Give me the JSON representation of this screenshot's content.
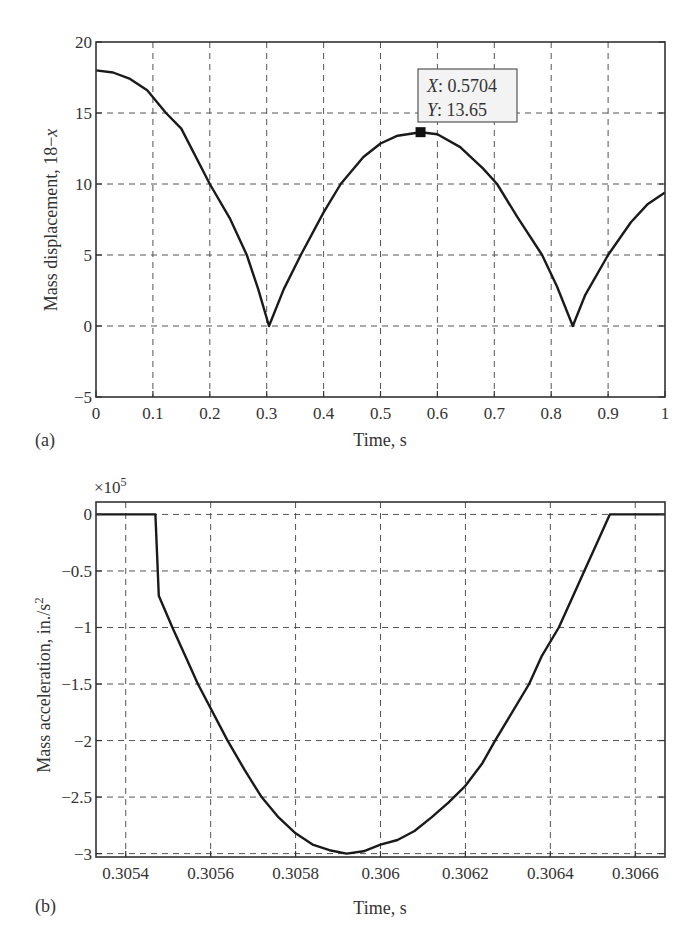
{
  "chart_data": [
    {
      "panel": "(a)",
      "type": "line",
      "title": "",
      "xlabel": "Time, s",
      "ylabel": "Mass displacement, 18−x",
      "ylabel_parts": {
        "main": "Mass displacement, 18−",
        "italic": "x"
      },
      "xlim": [
        0,
        1
      ],
      "ylim": [
        -5,
        20
      ],
      "xticks": [
        0,
        0.1,
        0.2,
        0.3,
        0.4,
        0.5,
        0.6,
        0.7,
        0.8,
        0.9,
        1
      ],
      "xtick_labels": [
        "0",
        "0.1",
        "0.2",
        "0.3",
        "0.4",
        "0.5",
        "0.6",
        "0.7",
        "0.8",
        "0.9",
        "1"
      ],
      "yticks": [
        -5,
        0,
        5,
        10,
        15,
        20
      ],
      "ytick_labels": [
        "−5",
        "0",
        "5",
        "10",
        "15",
        "20"
      ],
      "grid": true,
      "legend": null,
      "series": [
        {
          "name": "18-x",
          "x": [
            0,
            0.03,
            0.06,
            0.09,
            0.123,
            0.15,
            0.2,
            0.235,
            0.265,
            0.285,
            0.304,
            0.33,
            0.36,
            0.4,
            0.43,
            0.47,
            0.5,
            0.53,
            0.5704,
            0.6,
            0.64,
            0.68,
            0.705,
            0.74,
            0.784,
            0.81,
            0.838,
            0.86,
            0.9,
            0.94,
            0.97,
            1.0
          ],
          "y": [
            18,
            17.85,
            17.4,
            16.6,
            15,
            13.9,
            10,
            7.6,
            5,
            2.6,
            0,
            2.6,
            5,
            8,
            10,
            11.9,
            12.85,
            13.4,
            13.65,
            13.5,
            12.6,
            11.1,
            10,
            7.7,
            5,
            2.8,
            0,
            2.2,
            5,
            7.3,
            8.6,
            9.4
          ]
        }
      ],
      "annotations": [
        {
          "type": "datatip",
          "x": 0.5704,
          "y": 13.65,
          "x_label": "X",
          "x_text": ": 0.5704",
          "y_label": "Y",
          "y_text": ": 13.65"
        }
      ]
    },
    {
      "panel": "(b)",
      "type": "line",
      "title": "",
      "xlabel": "Time, s",
      "ylabel": "Mass acceleration, in./s²",
      "ylabel_parts": {
        "main": "Mass acceleration, in./s",
        "sup": "2"
      },
      "exponent_label": {
        "base": "×10",
        "exp": "5"
      },
      "xlim": [
        0.30533,
        0.30667
      ],
      "ylim": [
        -3.03,
        0.11
      ],
      "xticks": [
        0.3054,
        0.3056,
        0.3058,
        0.306,
        0.3062,
        0.3064,
        0.3066
      ],
      "xtick_labels": [
        "0.3054",
        "0.3056",
        "0.3058",
        "0.306",
        "0.3062",
        "0.3064",
        "0.3066"
      ],
      "yticks": [
        -3,
        -2.5,
        -2,
        -1.5,
        -1,
        -0.5,
        0
      ],
      "ytick_labels": [
        "−3",
        "−2.5",
        "−2",
        "−1.5",
        "−1",
        "−0.5",
        "0"
      ],
      "grid": true,
      "legend": null,
      "series": [
        {
          "name": "acceleration (×10^5 in./s²)",
          "x": [
            0.30533,
            0.30547,
            0.305478,
            0.30551,
            0.30554,
            0.30557,
            0.30564,
            0.30568,
            0.30572,
            0.30576,
            0.3058,
            0.30584,
            0.30588,
            0.30592,
            0.30596,
            0.306,
            0.30604,
            0.30608,
            0.30612,
            0.30616,
            0.3062,
            0.30624,
            0.30627,
            0.30631,
            0.30635,
            0.30638,
            0.30642,
            0.30645,
            0.30648,
            0.30651,
            0.30654,
            0.30656,
            0.30667
          ],
          "y": [
            0,
            0,
            -0.72,
            -1.0,
            -1.25,
            -1.5,
            -2.0,
            -2.26,
            -2.5,
            -2.68,
            -2.82,
            -2.92,
            -2.97,
            -3.0,
            -2.98,
            -2.92,
            -2.88,
            -2.8,
            -2.68,
            -2.55,
            -2.4,
            -2.2,
            -2.0,
            -1.75,
            -1.5,
            -1.25,
            -1.0,
            -0.75,
            -0.5,
            -0.25,
            0,
            0,
            0
          ]
        }
      ]
    }
  ],
  "panels": {
    "a": {
      "label": "(a)",
      "xlabel": "Time, s",
      "ylabel_main": "Mass displacement, 18−",
      "ylabel_italic": "x",
      "tooltip_x_key": "X",
      "tooltip_x_val": ": 0.5704",
      "tooltip_y_key": "Y",
      "tooltip_y_val": ": 13.65"
    },
    "b": {
      "label": "(b)",
      "xlabel": "Time, s",
      "ylabel_main": "Mass acceleration, in./s",
      "ylabel_sup": "2",
      "exp_base": "×10",
      "exp_power": "5"
    }
  }
}
